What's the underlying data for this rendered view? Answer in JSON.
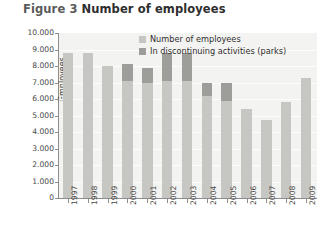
{
  "figure": {
    "number": "Figure 3",
    "title": "Number of employees"
  },
  "chart_data": {
    "type": "bar",
    "title": "Number of employees",
    "xlabel": "",
    "ylabel": "Employees",
    "ylim": [
      0,
      10000
    ],
    "ytick_labels": [
      "10.000",
      "9.000",
      "8.000",
      "7.000",
      "6.000",
      "5.000",
      "4.000",
      "3.000",
      "2.000",
      "1.000",
      "0"
    ],
    "ytick_values": [
      10000,
      9000,
      8000,
      7000,
      6000,
      5000,
      4000,
      3000,
      2000,
      1000,
      0
    ],
    "grid": true,
    "legend_position": "top-right-inside",
    "stacked": true,
    "categories": [
      "1997",
      "1998",
      "1999",
      "2000",
      "2001",
      "2002",
      "2003",
      "2004",
      "2005",
      "2006",
      "2007",
      "2008",
      "2009"
    ],
    "series": [
      {
        "name": "Number of employees",
        "color": "#c6c6c2",
        "values": [
          8800,
          8800,
          8000,
          8100,
          7900,
          8800,
          8800,
          7000,
          7000,
          5400,
          4700,
          5800,
          7300
        ]
      },
      {
        "name": "In discontinuing activities (parks)",
        "color": "#9d9d99",
        "values": [
          0,
          0,
          0,
          1000,
          900,
          1700,
          1700,
          800,
          1100,
          0,
          0,
          0,
          0
        ]
      }
    ]
  },
  "legend": {
    "items": [
      {
        "label": "Number of employees",
        "swatch": "s1"
      },
      {
        "label": "In discontinuing activities (parks)",
        "swatch": "s2"
      }
    ]
  },
  "colors": {
    "plot_background": "#f3f3f1",
    "axis": "#8d8d8d",
    "gridline": "#fdfdfc",
    "bar_light": "#c6c6c2",
    "bar_dark": "#9d9d99",
    "text": "#3d3d3d"
  }
}
